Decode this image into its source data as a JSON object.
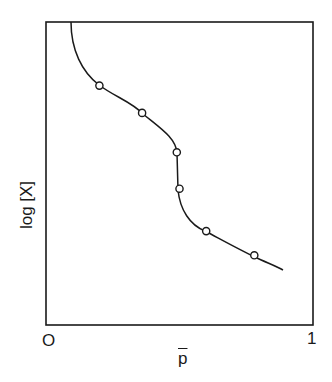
{
  "chart_data": {
    "type": "line",
    "title": "",
    "xlabel": "p̄",
    "ylabel": "log [X]",
    "xlim": [
      0,
      1
    ],
    "x_tick_labels": [
      "O",
      "1"
    ],
    "y_tick_labels": [],
    "grid": false,
    "legend": null,
    "series": [
      {
        "name": "curve-with-markers",
        "marker": "open-circle",
        "x": [
          0.2,
          0.36,
          0.49,
          0.5,
          0.6,
          0.78
        ],
        "y": [
          0.79,
          0.7,
          0.57,
          0.45,
          0.31,
          0.23
        ],
        "y_units": "relative (0 = bottom, 1 = top of axes)"
      }
    ],
    "curve_extent": {
      "x_start": 0.09,
      "y_start": 1.0,
      "x_end": 0.89,
      "y_end": 0.18
    }
  },
  "labels": {
    "origin": "O",
    "x_max": "1",
    "x_axis": "p",
    "y_axis": "log [X]"
  }
}
